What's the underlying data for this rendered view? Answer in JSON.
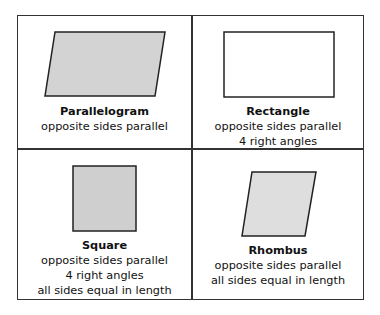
{
  "cells": [
    {
      "title": "Parallelogram",
      "lines": [
        "opposite sides parallel"
      ],
      "shape": "parallelogram",
      "fill": "#d3d3d3"
    },
    {
      "title": "Rectangle",
      "lines": [
        "opposite sides parallel",
        "4 right angles"
      ],
      "shape": "rectangle",
      "fill": "#ffffff"
    },
    {
      "title": "Square",
      "lines": [
        "opposite sides parallel",
        "4 right angles",
        "all sides equal in length"
      ],
      "shape": "square",
      "fill": "#cfcfcf"
    },
    {
      "title": "Rhombus",
      "lines": [
        "opposite sides parallel",
        "all sides equal in length"
      ],
      "shape": "rhombus",
      "fill": "#dedede"
    }
  ],
  "colors": {
    "stroke": "#222222",
    "border": "#333333"
  }
}
